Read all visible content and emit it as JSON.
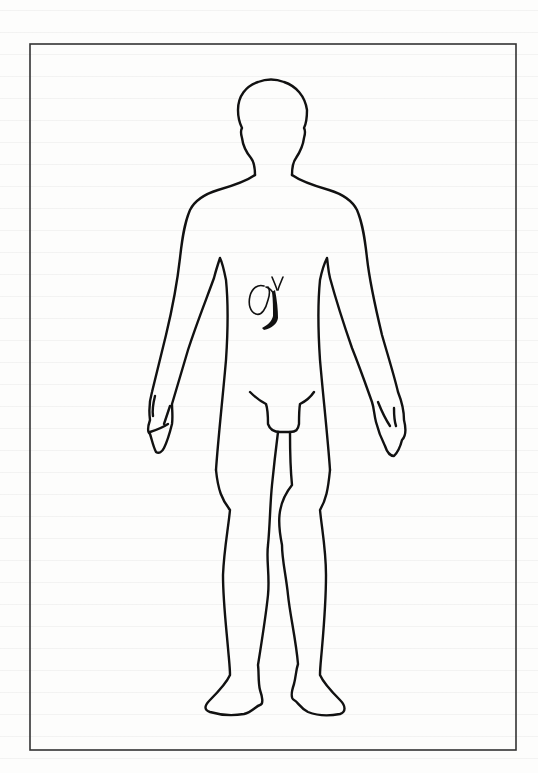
{
  "figure": {
    "type": "anatomical-body-outline",
    "view": "anterior",
    "highlighted_organ": "gallbladder with biliary ducts",
    "frame": {
      "x": 30,
      "y": 44,
      "width": 486,
      "height": 706,
      "stroke_color": "#333333"
    },
    "line_color": "#111111",
    "background_color": "#fdfdfc"
  },
  "labels": {
    "organ_name": "gallbladder"
  }
}
